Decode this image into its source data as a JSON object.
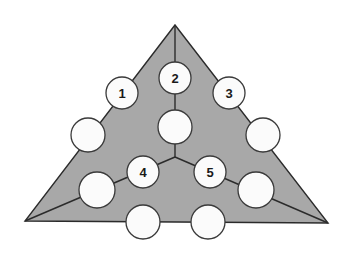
{
  "figure": {
    "background_color": "#ffffff",
    "width": 350,
    "height": 255
  },
  "triangle": {
    "name": "outer-triangle",
    "fill_color": "#a8a8a8",
    "stroke_color": "#2b2b2b",
    "stroke_width": 1.4,
    "vertices": [
      {
        "name": "apex",
        "x": 175,
        "y": 25
      },
      {
        "name": "bottom-right",
        "x": 328,
        "y": 223
      },
      {
        "name": "bottom-left",
        "x": 25,
        "y": 221
      }
    ]
  },
  "center_junction": {
    "name": "center-node",
    "x": 175,
    "y": 157
  },
  "internal_edges": [
    {
      "name": "spoke-to-apex",
      "x1": 175,
      "y1": 157,
      "x2": 175,
      "y2": 25
    },
    {
      "name": "spoke-to-bottom-left",
      "x1": 175,
      "y1": 157,
      "x2": 25,
      "y2": 221
    },
    {
      "name": "spoke-to-bottom-right",
      "x1": 175,
      "y1": 157,
      "x2": 328,
      "y2": 223
    }
  ],
  "circle_style": {
    "fill_color": "#fbfbfb",
    "stroke_color": "#3a3a3a",
    "stroke_width": 1.3,
    "radius": 16
  },
  "nodes": [
    {
      "id": "n1",
      "label": "1",
      "x": 122,
      "y": 93,
      "r": 16,
      "labelled": true
    },
    {
      "id": "n2",
      "label": "2",
      "x": 175,
      "y": 78,
      "r": 16,
      "labelled": true
    },
    {
      "id": "n3",
      "label": "3",
      "x": 229,
      "y": 93,
      "r": 16,
      "labelled": true
    },
    {
      "id": "n4",
      "label": "4",
      "x": 143,
      "y": 172,
      "r": 16,
      "labelled": true
    },
    {
      "id": "n5",
      "label": "5",
      "x": 210,
      "y": 172,
      "r": 16,
      "labelled": true
    },
    {
      "id": "n6",
      "label": "",
      "x": 88,
      "y": 135,
      "r": 17,
      "labelled": false
    },
    {
      "id": "n7",
      "label": "",
      "x": 175,
      "y": 127,
      "r": 17,
      "labelled": false
    },
    {
      "id": "n8",
      "label": "",
      "x": 263,
      "y": 135,
      "r": 17,
      "labelled": false
    },
    {
      "id": "n9",
      "label": "",
      "x": 97,
      "y": 190,
      "r": 18,
      "labelled": false
    },
    {
      "id": "n10",
      "label": "",
      "x": 256,
      "y": 190,
      "r": 18,
      "labelled": false
    },
    {
      "id": "n11",
      "label": "",
      "x": 143,
      "y": 222,
      "r": 17,
      "labelled": false
    },
    {
      "id": "n12",
      "label": "",
      "x": 208,
      "y": 222,
      "r": 17,
      "labelled": false
    }
  ]
}
